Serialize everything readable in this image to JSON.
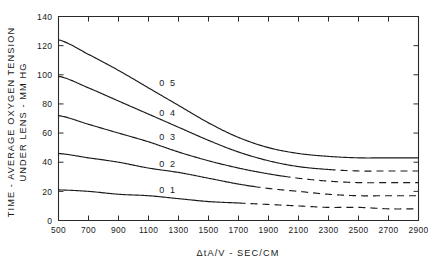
{
  "chart_data": {
    "type": "line",
    "title": "",
    "xlabel": "ΔtA/V  -  SEC/CM",
    "ylabel_line1": "TIME - AVERAGE  OXYGEN  TENSION",
    "ylabel_line2": "UNDER LENS - MM HG",
    "xlim": [
      500,
      2900
    ],
    "ylim": [
      0,
      140
    ],
    "grid": false,
    "legend_position": "inline-curve-labels",
    "xticks": [
      500,
      700,
      900,
      1100,
      1300,
      1500,
      1700,
      1900,
      2100,
      2300,
      2500,
      2700,
      2900
    ],
    "xticklabels": [
      "500",
      "700",
      "900",
      "1100",
      "1300",
      "1500",
      "1700",
      "1900",
      "2100",
      "2300",
      "2500",
      "2700",
      "2900"
    ],
    "yticks": [
      0,
      20,
      40,
      60,
      80,
      100,
      120,
      140
    ],
    "yticklabels": [
      "0",
      "20",
      "40",
      "60",
      "80",
      "100",
      "120",
      "140"
    ],
    "x": [
      500,
      700,
      900,
      1100,
      1300,
      1500,
      1700,
      1900,
      2100,
      2300,
      2500,
      2700,
      2900
    ],
    "series": [
      {
        "name": "0.5",
        "label": "0 5",
        "label_x": 1230,
        "label_y": 92,
        "solid_until": 2900,
        "values": [
          124,
          114,
          103,
          91,
          79,
          67,
          57,
          50,
          46,
          44,
          43,
          43,
          43
        ]
      },
      {
        "name": "0.4",
        "label": "0 4",
        "label_x": 1230,
        "label_y": 72,
        "solid_until": 2300,
        "values": [
          99,
          91,
          82,
          73,
          64,
          55,
          47,
          41,
          37,
          35,
          34,
          34,
          34
        ]
      },
      {
        "name": "0.3",
        "label": "0 3",
        "label_x": 1230,
        "label_y": 55,
        "solid_until": 2000,
        "values": [
          72,
          66,
          60,
          54,
          47,
          41,
          36,
          32,
          29,
          27,
          26,
          26,
          26
        ]
      },
      {
        "name": "0.2",
        "label": "0 2",
        "label_x": 1230,
        "label_y": 37,
        "solid_until": 1800,
        "values": [
          46,
          43,
          40,
          36,
          33,
          29,
          25,
          22,
          20,
          18,
          17,
          17,
          17
        ]
      },
      {
        "name": "0.1",
        "label": "0 1",
        "label_x": 1230,
        "label_y": 19,
        "solid_until": 1700,
        "values": [
          21,
          20,
          18,
          17,
          15,
          13,
          12,
          11,
          10,
          9,
          9,
          8,
          8
        ]
      }
    ]
  }
}
